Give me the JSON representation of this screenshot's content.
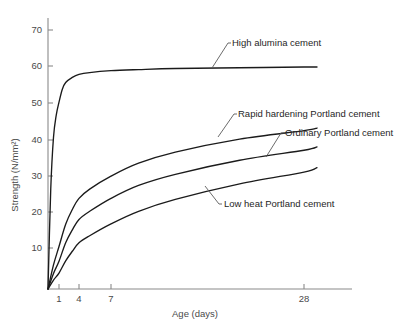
{
  "chart_data": {
    "type": "line",
    "title": "",
    "xlabel": "Age (days)",
    "ylabel": "Strength (N/mm²)",
    "x_tick_labels": [
      "1",
      "4",
      "7",
      "28"
    ],
    "x_tick_values": [
      1,
      4,
      7,
      28
    ],
    "y_tick_labels": [
      "10",
      "20",
      "30",
      "40",
      "50",
      "60",
      "70"
    ],
    "y_tick_values": [
      10,
      20,
      30,
      40,
      50,
      60,
      70
    ],
    "xlim": [
      0,
      34
    ],
    "ylim": [
      0,
      75
    ],
    "x_scale": "compressed-log-like",
    "grid": false,
    "legend": "inline-annotations",
    "series": [
      {
        "name": "High alumina cement",
        "label": "High alumina cement",
        "x": [
          0,
          0.25,
          0.5,
          0.75,
          1,
          1.5,
          2,
          3,
          4,
          5,
          7,
          10,
          14,
          21,
          28,
          31
        ],
        "values": [
          0,
          27,
          41,
          47,
          50.5,
          54,
          55.8,
          57.2,
          58.0,
          58.5,
          59.0,
          59.3,
          59.6,
          59.8,
          60.0,
          60.0
        ]
      },
      {
        "name": "Rapid hardening Portland cement",
        "label": "Rapid hardening Portland cement",
        "x": [
          0,
          0.5,
          1,
          2,
          3,
          4,
          5,
          7,
          10,
          14,
          21,
          28,
          31
        ],
        "values": [
          0,
          6.5,
          11.5,
          17.5,
          21.5,
          24.5,
          27.0,
          30.5,
          34.0,
          37.0,
          40.5,
          42.8,
          43.5
        ]
      },
      {
        "name": "Ordinary Portland cement",
        "label": "Ordinary Portland cement",
        "x": [
          0,
          0.5,
          1,
          2,
          3,
          4,
          5,
          7,
          10,
          14,
          21,
          28,
          31
        ],
        "values": [
          0,
          4.2,
          7.5,
          12.5,
          16.0,
          18.8,
          21.0,
          24.5,
          28.0,
          31.0,
          34.8,
          37.5,
          38.4
        ]
      },
      {
        "name": "Low heat Portland cement",
        "label": "Low heat Portland cement",
        "x": [
          0,
          0.5,
          1,
          2,
          3,
          4,
          5,
          7,
          10,
          14,
          21,
          28,
          31
        ],
        "values": [
          0,
          2.4,
          4.3,
          7.6,
          10.2,
          12.5,
          14.4,
          17.6,
          21.0,
          24.2,
          28.4,
          31.6,
          32.8
        ]
      }
    ],
    "annotations": [
      {
        "text": "High alumina cement",
        "anchor_x": 232,
        "anchor_y": 46,
        "leader": "M212,68 L228,43 L231,43"
      },
      {
        "text": "Rapid hardening Portland cement",
        "anchor_x": 238,
        "anchor_y": 117,
        "leader": "M218,137 L234,114 L237,114"
      },
      {
        "text": "Ordinary Portland cement",
        "anchor_x": 285,
        "anchor_y": 136,
        "leader": "M266,157 L281,133 L284,133"
      },
      {
        "text": "Low heat Portland cement",
        "anchor_x": 224,
        "anchor_y": 207,
        "leader": "M205,186 L219,204 L222,204"
      }
    ]
  }
}
